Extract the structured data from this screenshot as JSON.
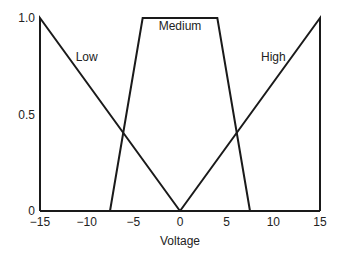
{
  "chart_data": {
    "type": "line",
    "title": "",
    "xlabel": "Voltage",
    "ylabel": "",
    "xlim": [
      -15,
      15
    ],
    "ylim": [
      0,
      1.0
    ],
    "grid": false,
    "x_ticks": [
      "-15",
      "-10",
      "-5",
      "0",
      "5",
      "10",
      "15"
    ],
    "x_tick_values": [
      -15,
      -10,
      -5,
      0,
      5,
      10,
      15
    ],
    "y_ticks": [
      "0",
      "0.5",
      "1.0"
    ],
    "y_tick_values": [
      0,
      0.5,
      1.0
    ],
    "series": [
      {
        "name": "Low",
        "points": [
          [
            -15,
            0
          ],
          [
            -15,
            1.0
          ],
          [
            0,
            0
          ]
        ],
        "label_pos": [
          -10,
          0.8
        ]
      },
      {
        "name": "Medium",
        "points": [
          [
            -7.5,
            0
          ],
          [
            -4,
            1.0
          ],
          [
            4,
            1.0
          ],
          [
            7.5,
            0
          ]
        ],
        "label_pos": [
          0,
          0.96
        ]
      },
      {
        "name": "High",
        "points": [
          [
            0,
            0
          ],
          [
            15,
            1.0
          ],
          [
            15,
            0
          ]
        ],
        "label_pos": [
          10,
          0.8
        ]
      }
    ]
  }
}
